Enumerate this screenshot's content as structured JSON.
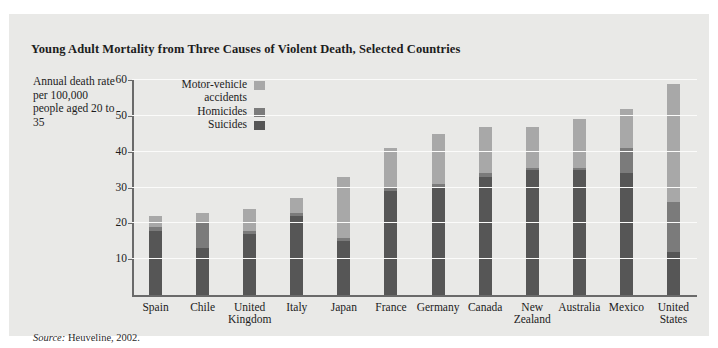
{
  "figure": {
    "title": "Young Adult Mortality from Three Causes of Violent Death, Selected Countries",
    "axis_caption": "Annual death rate per 100,000 people aged 20 to 35",
    "source_prefix": "Source:",
    "source_text": "Heuveline, 2002.",
    "panel_color": "#e9e9e7",
    "rule_color": "#5d5d5d"
  },
  "chart_data": {
    "type": "bar",
    "subtype": "stacked-vertical",
    "title": "Young Adult Mortality from Three Causes of Violent Death, Selected Countries",
    "xlabel": "",
    "ylabel": "Annual death rate per 100,000 people aged 20 to 35",
    "ylim": [
      0,
      60
    ],
    "yticks": [
      10,
      20,
      30,
      40,
      50,
      60
    ],
    "grid": true,
    "legend_position": "top-left-inside",
    "categories": [
      "Spain",
      "Chile",
      "United Kingdom",
      "Italy",
      "Japan",
      "France",
      "Germany",
      "Canada",
      "New Zealand",
      "Australia",
      "Mexico",
      "United States"
    ],
    "series": [
      {
        "name": "Suicides",
        "color": "#565656",
        "values": [
          18,
          13,
          17,
          22,
          15,
          29,
          30,
          33,
          35,
          35,
          34,
          12
        ]
      },
      {
        "name": "Homicides",
        "color": "#7b7b7b",
        "values": [
          1,
          7,
          1,
          1,
          1,
          1,
          1,
          1,
          0.5,
          0.5,
          7,
          14
        ]
      },
      {
        "name": "Motor-vehicle accidents",
        "color": "#a8a8a8",
        "values": [
          3,
          3,
          6,
          4,
          17,
          11,
          14,
          13,
          11.5,
          13.5,
          11,
          33
        ]
      }
    ],
    "totals": [
      22,
      23,
      24,
      27,
      33,
      41,
      45,
      47,
      47,
      49,
      52,
      59
    ]
  },
  "legend": {
    "items": [
      {
        "label": "Motor-vehicle accidents",
        "color": "#a8a8a8"
      },
      {
        "label": "Homicides",
        "color": "#7b7b7b"
      },
      {
        "label": "Suicides",
        "color": "#565656"
      }
    ]
  }
}
